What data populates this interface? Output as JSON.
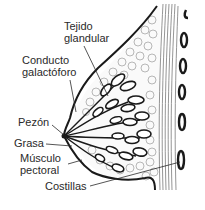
{
  "diagram": {
    "colors": {
      "outline": "#1a1a1a",
      "tissue": "#8a8a8a",
      "background": "#ffffff",
      "text": "#2a2a2a"
    },
    "labels": [
      {
        "id": "tejido",
        "line1": "Tejido",
        "line2": "glandular"
      },
      {
        "id": "conducto",
        "line1": "Conducto",
        "line2": "galactóforo"
      },
      {
        "id": "pezon",
        "line1": "Pezón"
      },
      {
        "id": "grasa",
        "line1": "Grasa"
      },
      {
        "id": "musculo",
        "line1": "Músculo",
        "line2": "pectoral"
      },
      {
        "id": "costillas",
        "line1": "Costillas"
      }
    ]
  }
}
